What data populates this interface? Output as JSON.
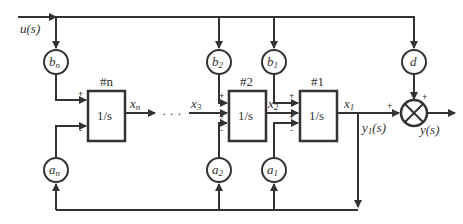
{
  "diagram": {
    "type": "block-diagram",
    "input": "u(s)",
    "output": "y(s)",
    "intermediate_output": "y1(s)",
    "integrators": [
      {
        "id": "#n",
        "label": "1/s",
        "output": "xn"
      },
      {
        "id": "#2",
        "label": "1/s",
        "input_state": "x3",
        "output": "x2"
      },
      {
        "id": "#1",
        "label": "1/s",
        "output": "x1"
      }
    ],
    "input_gains": [
      {
        "name": "b",
        "sub": "n"
      },
      {
        "name": "b",
        "sub": "2"
      },
      {
        "name": "b",
        "sub": "1"
      }
    ],
    "feedback_gains": [
      {
        "name": "a",
        "sub": "n"
      },
      {
        "name": "a",
        "sub": "2"
      },
      {
        "name": "a",
        "sub": "1"
      }
    ],
    "feedthrough_gain": "d",
    "ellipsis": "· · ·",
    "signs": {
      "plus": "+",
      "minus": "-"
    },
    "summing_junction": "⊗",
    "line_color": "#333333"
  }
}
